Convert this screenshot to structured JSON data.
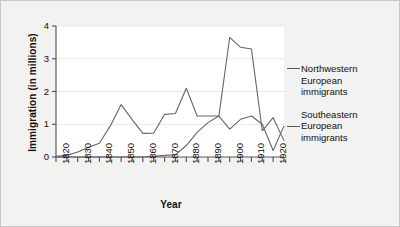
{
  "chart_data": {
    "type": "line",
    "title": "",
    "xlabel": "Year",
    "ylabel": "Immigration (in millions)",
    "xlim": [
      1820,
      1925
    ],
    "ylim": [
      0,
      4
    ],
    "y_ticks": [
      "0",
      "1",
      "2",
      "3",
      "4"
    ],
    "y_tick_values": [
      0,
      1,
      2,
      3,
      4
    ],
    "x_tick_labels": [
      "1820",
      "1830",
      "1840",
      "1850",
      "1860",
      "1870",
      "1880",
      "1890",
      "1900",
      "1910",
      "1920"
    ],
    "x_tick_values": [
      1820,
      1830,
      1840,
      1850,
      1860,
      1870,
      1880,
      1890,
      1900,
      1910,
      1920
    ],
    "x_minor_tick_step": 5,
    "grid": "horizontal-light",
    "legend_position": "right",
    "x": [
      1820,
      1825,
      1830,
      1835,
      1840,
      1845,
      1850,
      1855,
      1860,
      1865,
      1870,
      1875,
      1880,
      1885,
      1890,
      1895,
      1900,
      1905,
      1910,
      1915,
      1920,
      1925
    ],
    "series": [
      {
        "name": "Northwestern European immigrants",
        "color": "#666666",
        "values": [
          0.02,
          0.05,
          0.15,
          0.3,
          0.42,
          0.95,
          1.6,
          1.15,
          0.72,
          0.73,
          1.3,
          1.33,
          2.1,
          1.25,
          1.25,
          1.25,
          3.65,
          3.35,
          3.3,
          0.8,
          1.2,
          0.5
        ]
      },
      {
        "name": "Southeastern European immigrants",
        "color": "#666666",
        "values": [
          0.0,
          0.0,
          0.0,
          0.0,
          0.0,
          0.0,
          0.0,
          0.0,
          0.0,
          0.02,
          0.05,
          0.07,
          0.35,
          0.75,
          1.05,
          1.25,
          0.85,
          1.15,
          1.25,
          1.0,
          0.2,
          0.95
        ]
      }
    ]
  },
  "legend": {
    "entries": [
      {
        "line1": "Northwestern",
        "line2": "European",
        "line3": "immigrants"
      },
      {
        "line1": "Southeastern",
        "line2": "European",
        "line3": "immigrants"
      }
    ]
  },
  "axes": {
    "y_title": "Immigration (in millions)",
    "x_title": "Year"
  }
}
